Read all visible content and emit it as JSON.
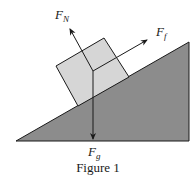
{
  "figure": {
    "caption": "Figure 1",
    "colors": {
      "incline_fill": "#8c8c8c",
      "block_fill": "#d6d6d6",
      "stroke": "#1a1a1a",
      "background": "#ffffff"
    }
  },
  "forces": {
    "normal": {
      "symbol": "F",
      "subscript": "N"
    },
    "friction": {
      "symbol": "F",
      "subscript": "f"
    },
    "gravity": {
      "symbol": "F",
      "subscript": "g"
    }
  }
}
